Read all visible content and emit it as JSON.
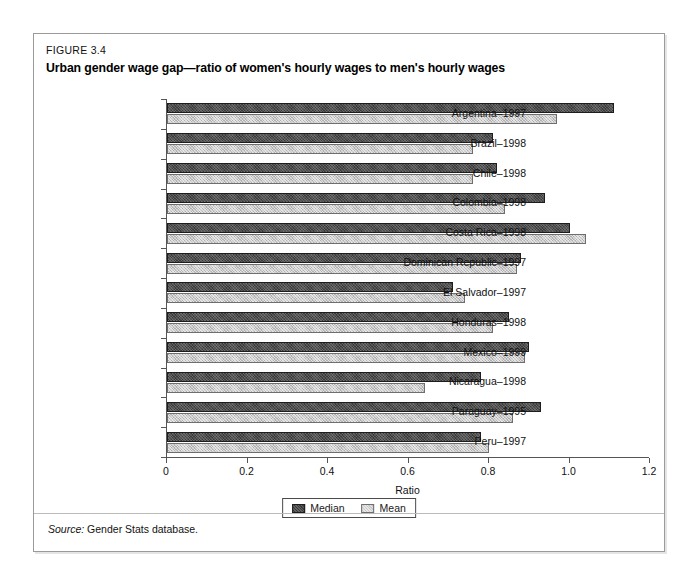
{
  "figure": {
    "number": "FIGURE 3.4",
    "title": "Urban gender wage gap—ratio of women's hourly wages to men's hourly wages",
    "source_label": "Source:",
    "source_text": "Gender Stats database."
  },
  "legend": {
    "items": [
      {
        "label": "Median",
        "color": "#3b3b3b"
      },
      {
        "label": "Mean",
        "color": "#c9c9c9"
      }
    ]
  },
  "chart_data": {
    "type": "bar",
    "orientation": "horizontal",
    "title": "Urban gender wage gap—ratio of women's hourly wages to men's hourly wages",
    "xlabel": "Ratio",
    "ylabel": "",
    "xlim": [
      0,
      1.2
    ],
    "xticks": [
      0,
      0.2,
      0.4,
      0.6,
      0.8,
      1.0,
      1.2
    ],
    "xticklabels": [
      "0",
      "0.2",
      "0.4",
      "0.6",
      "0.8",
      "1.0",
      "1.2"
    ],
    "grid": false,
    "legend_position": "bottom-center",
    "categories": [
      "Argentina–1997",
      "Brazil–1998",
      "Chile–1998",
      "Colombia–1998",
      "Costa Rica–1998",
      "Dominican Republic–1997",
      "El Salvador–1997",
      "Honduras–1998",
      "Mexico–1999",
      "Nicaragua–1998",
      "Paraguay–1995",
      "Peru–1997"
    ],
    "series": [
      {
        "name": "Median",
        "color": "#3b3b3b",
        "values": [
          1.11,
          0.81,
          0.82,
          0.94,
          1.0,
          0.88,
          0.71,
          0.85,
          0.9,
          0.78,
          0.93,
          0.78
        ]
      },
      {
        "name": "Mean",
        "color": "#c9c9c9",
        "values": [
          0.97,
          0.76,
          0.76,
          0.84,
          1.04,
          0.87,
          0.74,
          0.81,
          0.89,
          0.64,
          0.86,
          0.8
        ]
      }
    ]
  }
}
